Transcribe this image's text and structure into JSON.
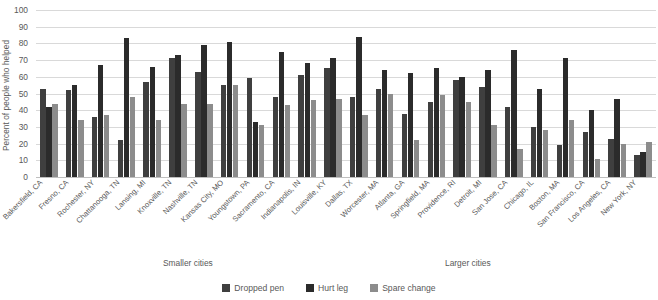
{
  "chart_data": {
    "type": "bar",
    "title": "",
    "xlabel": "",
    "ylabel": "Percent of people who helped",
    "ylim": [
      0,
      100
    ],
    "ytick_step": 10,
    "grid": true,
    "legend_position": "bottom",
    "yticks": [
      "100",
      "90",
      "80",
      "70",
      "60",
      "50",
      "40",
      "30",
      "20",
      "10",
      "0"
    ],
    "categories": [
      "Bakersfield, CA",
      "Fresno, CA",
      "Rochester, NY",
      "Chattanooga, TN",
      "Lansing, MI",
      "Knoxville, TN",
      "Nashville, TN",
      "Kansas City, MO",
      "Youngstown, PA",
      "Sacramento, CA",
      "Indianapolis, IN",
      "Louisville, KY",
      "Dallas, TX",
      "Worcester, MA",
      "Atlanta, GA",
      "Springfield, MA",
      "Providence, RI",
      "Detroit, MI",
      "San Jose, CA",
      "Chicago, IL",
      "Boston, MA",
      "San Francisco, CA",
      "Los Angeles, CA",
      "New York, NY"
    ],
    "series": [
      {
        "name": "Dropped pen",
        "color": "#3f3f3f",
        "values": [
          53,
          52,
          36,
          22,
          57,
          71,
          63,
          55,
          59,
          48,
          61,
          65,
          48,
          53,
          38,
          45,
          58,
          54,
          42,
          30,
          19,
          27,
          23,
          13
        ]
      },
      {
        "name": "Hurt leg",
        "color": "#2b2b2b",
        "values": [
          42,
          55,
          67,
          83,
          66,
          73,
          79,
          81,
          33,
          75,
          68,
          71,
          84,
          64,
          62,
          65,
          60,
          64,
          76,
          53,
          71,
          40,
          47,
          15
        ]
      },
      {
        "name": "Spare change",
        "color": "#8c8c8c",
        "values": [
          44,
          34,
          37,
          48,
          34,
          44,
          44,
          55,
          31,
          43,
          46,
          47,
          37,
          50,
          22,
          49,
          45,
          31,
          17,
          28,
          34,
          11,
          20,
          21
        ]
      }
    ],
    "annotations": [
      {
        "text": "Smaller cities",
        "name": "smaller-cities-note"
      },
      {
        "text": "Larger cities",
        "name": "larger-cities-note"
      }
    ]
  }
}
